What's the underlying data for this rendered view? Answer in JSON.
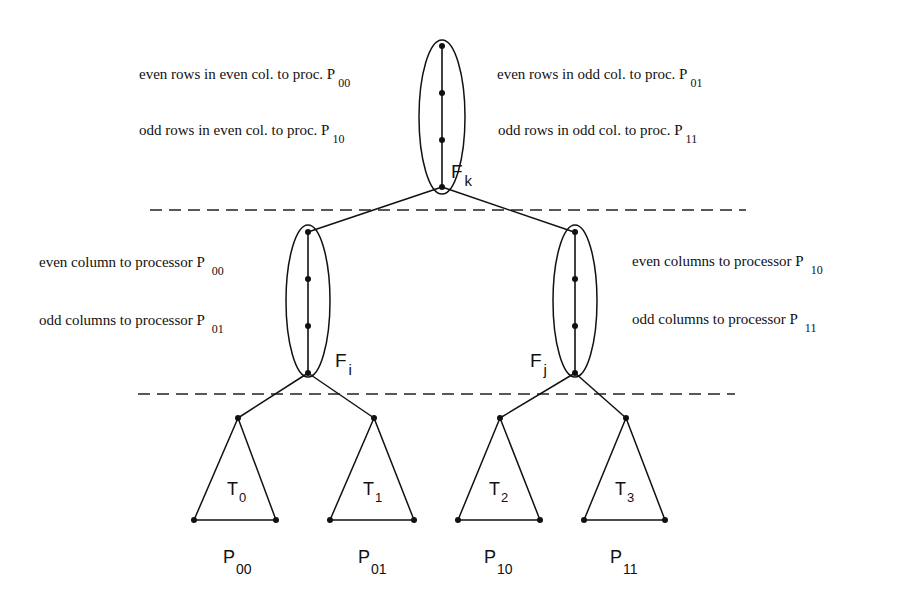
{
  "top_front": {
    "label": "F",
    "sub": "k",
    "left_notes": [
      {
        "text": "even rows in even col. to proc. P",
        "sub": "00"
      },
      {
        "text": "odd rows in even col. to proc. P",
        "sub": "10"
      }
    ],
    "right_notes": [
      {
        "text": "even rows in odd col. to proc. P",
        "sub": "01"
      },
      {
        "text": "odd rows in odd col. to proc. P",
        "sub": "11"
      }
    ]
  },
  "left_front": {
    "label": "F",
    "sub": "i",
    "notes": [
      {
        "text": "even column to processor P",
        "sub": "00"
      },
      {
        "text": "odd columns to processor P",
        "sub": "01"
      }
    ]
  },
  "right_front": {
    "label": "F",
    "sub": "j",
    "notes": [
      {
        "text": "even columns to processor P",
        "sub": "10"
      },
      {
        "text": "odd columns to processor P",
        "sub": "11"
      }
    ]
  },
  "subtrees": [
    {
      "label": "T",
      "sub": "0",
      "proc": "P",
      "proc_sub": "00"
    },
    {
      "label": "T",
      "sub": "1",
      "proc": "P",
      "proc_sub": "01"
    },
    {
      "label": "T",
      "sub": "2",
      "proc": "P",
      "proc_sub": "10"
    },
    {
      "label": "T",
      "sub": "3",
      "proc": "P",
      "proc_sub": "11"
    }
  ]
}
